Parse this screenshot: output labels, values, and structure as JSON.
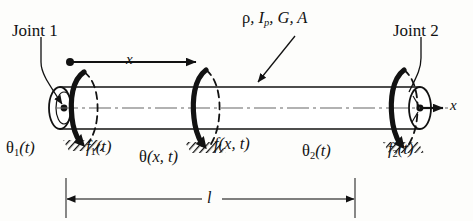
{
  "figure": {
    "title_internal": "torsional-shaft-element-diagram",
    "background_color": "#fdfdfb",
    "ink_color": "#121212"
  },
  "labels": {
    "joint1": "Joint 1",
    "joint2": "Joint 2",
    "properties": {
      "rho": "ρ",
      "comma1": ", ",
      "I": "I",
      "I_sub": "p",
      "comma2": ", ",
      "G": "G",
      "comma3": ", ",
      "A": "A",
      "full": "ρ, Ip, G, A"
    },
    "x_axis_top": "x",
    "x_axis_right": "x",
    "theta1": {
      "greek": "θ",
      "sub": "1",
      "arg": "(t)"
    },
    "f1": {
      "letter": "f",
      "sub": "1",
      "arg": "(t)"
    },
    "theta_field": {
      "greek": "θ",
      "arg": "(x, t)"
    },
    "f_field": {
      "letter": "f",
      "arg": "(x, t)"
    },
    "theta2": {
      "greek": "θ",
      "sub": "2",
      "arg": "(t)"
    },
    "f2": {
      "letter": "f",
      "sub": "2",
      "arg": "(t)"
    },
    "length": "l"
  },
  "geometry": {
    "shaft": {
      "left_x": 60,
      "right_x": 420,
      "top_y": 88,
      "bottom_y": 128,
      "center_y": 108,
      "ellipse_rx": 11,
      "ellipse_ry": 21
    },
    "dimension_line": {
      "left_x": 66,
      "right_x": 355,
      "y": 199
    },
    "x_arrow_top": {
      "start_x": 67,
      "end_x": 200,
      "y": 62
    },
    "torque_arrows_x": [
      77,
      200,
      398
    ]
  }
}
